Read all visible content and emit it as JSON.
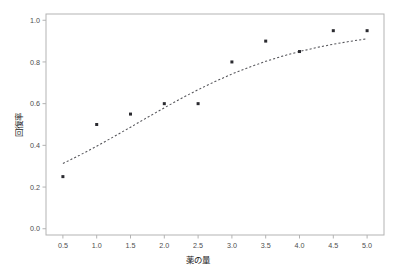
{
  "chart_data": {
    "type": "scatter",
    "title": "",
    "subtitle": "",
    "xlabel": "薬の量",
    "ylabel": "回復率",
    "xlim": [
      0.25,
      5.25
    ],
    "ylim": [
      -0.03,
      1.03
    ],
    "grid": false,
    "legend": false,
    "legend_position": "none",
    "x_ticks": [
      0.5,
      1.0,
      1.5,
      2.0,
      2.5,
      3.0,
      3.5,
      4.0,
      4.5,
      5.0
    ],
    "x_tick_labels": [
      "0.5",
      "1.0",
      "1.5",
      "2.0",
      "2.5",
      "3.0",
      "3.5",
      "4.0",
      "4.5",
      "5.0"
    ],
    "y_ticks": [
      0.0,
      0.2,
      0.4,
      0.6,
      0.8,
      1.0
    ],
    "y_tick_labels": [
      "0.0",
      "0.2",
      "0.4",
      "0.6",
      "0.8",
      "1.0"
    ],
    "x": [
      0.5,
      1.0,
      1.5,
      2.0,
      2.5,
      3.0,
      3.5,
      4.0,
      4.5,
      5.0
    ],
    "values": [
      0.25,
      0.5,
      0.55,
      0.6,
      0.6,
      0.8,
      0.9,
      0.85,
      0.95,
      0.95
    ],
    "series": [
      {
        "name": "観測値",
        "type": "scatter",
        "marker": "square",
        "color": "#2b2b30",
        "x": [
          0.5,
          1.0,
          1.5,
          2.0,
          2.5,
          3.0,
          3.5,
          4.0,
          4.5,
          5.0
        ],
        "values": [
          0.25,
          0.5,
          0.55,
          0.6,
          0.6,
          0.8,
          0.9,
          0.85,
          0.95,
          0.95
        ]
      },
      {
        "name": "回帰曲線",
        "type": "line",
        "style": "dashed",
        "color": "#55555a",
        "x": [
          0.5,
          0.75,
          1.0,
          1.25,
          1.5,
          1.75,
          2.0,
          2.25,
          2.5,
          2.75,
          3.0,
          3.25,
          3.5,
          3.75,
          4.0,
          4.25,
          4.5,
          4.75,
          5.0
        ],
        "values": [
          0.313,
          0.353,
          0.396,
          0.441,
          0.487,
          0.534,
          0.58,
          0.625,
          0.667,
          0.706,
          0.742,
          0.774,
          0.803,
          0.828,
          0.85,
          0.869,
          0.885,
          0.899,
          0.911
        ]
      }
    ],
    "colors": {
      "point": "#2b2b30",
      "curve": "#55555a",
      "frame": "#b3b3b3",
      "tick_text": "#4d4d4d",
      "axis_title": "#1a1a1a",
      "background": "#ffffff"
    }
  }
}
